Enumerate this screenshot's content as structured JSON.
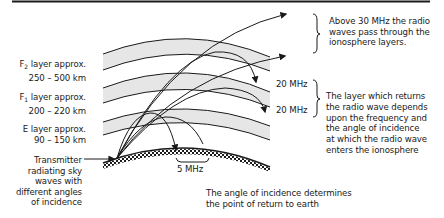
{
  "diagram": {
    "layers": [
      {
        "name": "F",
        "sub": "2",
        "label_line1": "layer approx.",
        "label_line2": "250 – 500 km"
      },
      {
        "name": "F",
        "sub": "1",
        "label_line1": "layer approx.",
        "label_line2": "200 – 220 km"
      },
      {
        "name": "E",
        "sub": "",
        "label_line1": "layer approx.",
        "label_line2": "90 – 150 km"
      }
    ],
    "transmitter": {
      "lines": [
        "Transmitter",
        "radiating sky",
        "waves with",
        "different angles",
        "of incidence"
      ]
    },
    "frequencies": {
      "upper": "20 MHz",
      "lower": "20 MHz",
      "ground": "5 MHz"
    },
    "notes": {
      "above30": [
        "Above 30 MHz the radio",
        "waves pass through the",
        "ionosphere layers."
      ],
      "layer_return": [
        "The layer which returns",
        "the radio wave depends",
        "upon the frequency and",
        "the angle of incidence",
        "at which the radio wave",
        "enters the ionosphere"
      ],
      "angle": [
        "The angle of incidence determines",
        "the point of return to earth"
      ]
    },
    "colors": {
      "band_fill": "#e6e6e6",
      "line": "#1a1a1a",
      "background": "#ffffff"
    }
  }
}
